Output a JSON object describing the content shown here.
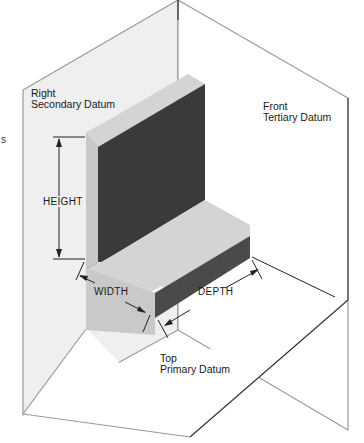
{
  "diagram": {
    "planes": {
      "right": {
        "name": "Right",
        "subtitle": "Secondary Datum"
      },
      "front": {
        "name": "Front",
        "subtitle": "Tertiary Datum"
      },
      "top": {
        "name": "Top",
        "subtitle": "Primary Datum"
      }
    },
    "dimensions": {
      "height": "HEIGHT",
      "width": "WIDTH",
      "depth": "DEPTH"
    },
    "stray_glyph": "s",
    "colors": {
      "plane_right_fill": "#efefef",
      "plane_front_fill": "#ffffff",
      "plane_top_fill": "#ffffff",
      "plane_edge": "#9a9a9a",
      "block_top_face": "#d4d4d4",
      "block_left_face": "#bdbdbd",
      "block_dark_face": "#3a3a3a",
      "block_front_dark": "#4a4a4a",
      "line": "#222222"
    }
  }
}
